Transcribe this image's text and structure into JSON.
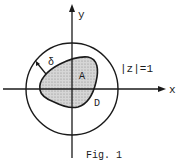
{
  "figure": {
    "caption": "Fig. 1",
    "axes": {
      "x_label": "x",
      "y_label": "y"
    },
    "circle_label": "|z|=1",
    "region_inner_label": "A",
    "region_outer_label": "D",
    "distance_label": "δ",
    "colors": {
      "stroke": "#1a1a1a",
      "fill_hatch": "#bdbdbd",
      "background": "#ffffff"
    }
  }
}
